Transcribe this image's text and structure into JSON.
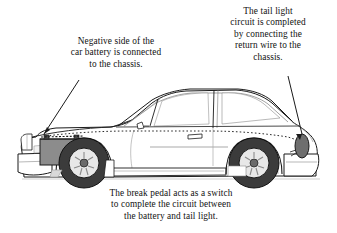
{
  "figure": {
    "background_color": "#ffffff",
    "width": 337,
    "height": 233
  },
  "annotations": {
    "battery_note": {
      "text": "Negative side of the\ncar battery is connected\nto the chassis.",
      "position": "upper-left"
    },
    "taillight_note": {
      "text": "The tail light\ncircuit is completed\nby connecting the\nreturn wire to the\nchassis.",
      "position": "upper-right"
    },
    "pedal_note": {
      "text": "The break pedal acts as a switch\nto complete the circuit between\nthe battery and tail light.",
      "position": "bottom-center"
    }
  },
  "illustration": {
    "subject": "car-side-view",
    "facing": "left",
    "parts": {
      "battery": "car-battery",
      "taillight": "tail-light",
      "wire": "return-wire",
      "front_wheel": "front-wheel",
      "rear_wheel": "rear-wheel",
      "body": "car-body-outline"
    }
  },
  "colors": {
    "line": "#1a1a1a",
    "body_fill": "#ffffff",
    "battery_fill": "#8c8c8c",
    "taillight_fill": "#6e6e6e",
    "tire_fill": "#3b3b3b",
    "hubcap_fill": "#e8e8e8",
    "wire": "#2b2b2b",
    "shadow": "#d9d9d9"
  }
}
